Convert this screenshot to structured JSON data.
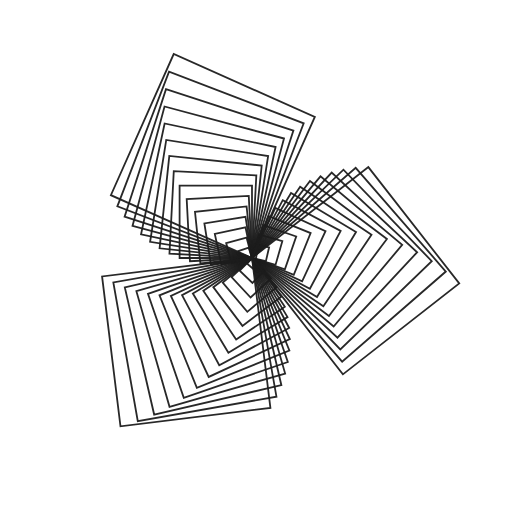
{
  "page": {
    "width": 510,
    "height": 516,
    "background": "#ffffff"
  },
  "artwork": {
    "kind": "turtle-graphics-spiral-of-squares",
    "description": "Overlapping rotated squares sharing a corner at the center, forming a spirograph-like rosette with three-fold central petals, scalloped concentric rings and an outer ring of right-angle corners",
    "background": "#ffffff",
    "stroke": {
      "color": "#1c1c1c",
      "width": 1.8,
      "opacity": 0.95,
      "linejoin": "miter"
    },
    "center": {
      "x": 252,
      "y": 258
    },
    "square_count": 45,
    "turn_angle_deg": 121,
    "initial_heading_deg": -80,
    "initial_side": 4,
    "side_increment": 3.42
  }
}
